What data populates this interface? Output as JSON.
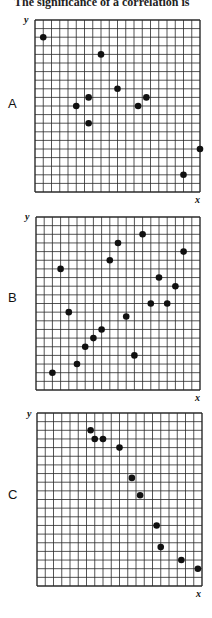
{
  "caption": "The significance of a correlation is",
  "chart_data": [
    {
      "type": "scatter",
      "label": "A",
      "xlabel": "x",
      "ylabel": "y",
      "grid": true,
      "grid_cells": [
        20,
        20
      ],
      "xlim": [
        0,
        20
      ],
      "ylim": [
        0,
        20
      ],
      "points": [
        {
          "x": 1,
          "y": 18
        },
        {
          "x": 8,
          "y": 16
        },
        {
          "x": 10,
          "y": 12
        },
        {
          "x": 6.5,
          "y": 11
        },
        {
          "x": 5,
          "y": 10
        },
        {
          "x": 6.5,
          "y": 8
        },
        {
          "x": 13.5,
          "y": 11
        },
        {
          "x": 12.5,
          "y": 10
        },
        {
          "x": 20,
          "y": 5
        },
        {
          "x": 18,
          "y": 2
        }
      ]
    },
    {
      "type": "scatter",
      "label": "B",
      "xlabel": "x",
      "ylabel": "y",
      "grid": true,
      "grid_cells": [
        20,
        20
      ],
      "xlim": [
        0,
        20
      ],
      "ylim": [
        0,
        20
      ],
      "points": [
        {
          "x": 2,
          "y": 2
        },
        {
          "x": 3,
          "y": 14
        },
        {
          "x": 4,
          "y": 9
        },
        {
          "x": 5,
          "y": 3
        },
        {
          "x": 6,
          "y": 5
        },
        {
          "x": 7,
          "y": 6
        },
        {
          "x": 8,
          "y": 7
        },
        {
          "x": 9,
          "y": 15
        },
        {
          "x": 10,
          "y": 17
        },
        {
          "x": 11,
          "y": 8.5
        },
        {
          "x": 12,
          "y": 4
        },
        {
          "x": 13,
          "y": 18
        },
        {
          "x": 14,
          "y": 10
        },
        {
          "x": 15,
          "y": 13
        },
        {
          "x": 16,
          "y": 10
        },
        {
          "x": 17,
          "y": 12
        },
        {
          "x": 18,
          "y": 16
        }
      ]
    },
    {
      "type": "scatter",
      "label": "C",
      "xlabel": "x",
      "ylabel": "y",
      "grid": true,
      "grid_cells": [
        20,
        20
      ],
      "xlim": [
        0,
        20
      ],
      "ylim": [
        0,
        20
      ],
      "points": [
        {
          "x": 6.5,
          "y": 18
        },
        {
          "x": 7,
          "y": 17
        },
        {
          "x": 8,
          "y": 17
        },
        {
          "x": 10,
          "y": 16
        },
        {
          "x": 11.5,
          "y": 12.5
        },
        {
          "x": 12.5,
          "y": 10.5
        },
        {
          "x": 14.5,
          "y": 7
        },
        {
          "x": 15,
          "y": 4.5
        },
        {
          "x": 17.5,
          "y": 3
        },
        {
          "x": 19.5,
          "y": 2
        }
      ]
    }
  ],
  "panels": [
    {
      "label": "A",
      "xlabel": "x",
      "ylabel": "y"
    },
    {
      "label": "B",
      "xlabel": "x",
      "ylabel": "y"
    },
    {
      "label": "C",
      "xlabel": "x",
      "ylabel": "y"
    }
  ],
  "style": {
    "grid_color": "#2a2a2a",
    "point_color": "#111111"
  }
}
